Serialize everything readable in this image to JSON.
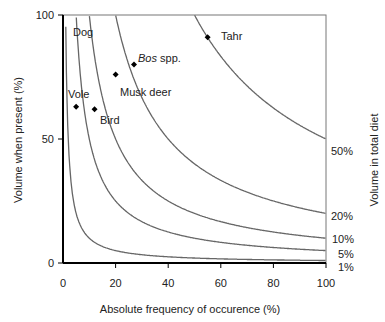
{
  "chart_data": {
    "type": "line",
    "title": "",
    "xlabel": "Absolute frequency of occurence (%)",
    "ylabel": "Volume when present (%)",
    "ylabel_right": "Volume in total diet",
    "xlim": [
      0,
      100
    ],
    "ylim": [
      0,
      100
    ],
    "x_ticks": [
      "0",
      "20",
      "40",
      "60",
      "80",
      "100"
    ],
    "y_ticks": [
      "0",
      "50",
      "100"
    ],
    "grid": false,
    "isolines": [
      {
        "name": "50%",
        "product": 5000
      },
      {
        "name": "20%",
        "product": 2000
      },
      {
        "name": "10%",
        "product": 1000
      },
      {
        "name": "5%",
        "product": 500
      },
      {
        "name": "1%",
        "product": 100
      }
    ],
    "points": [
      {
        "label": "Vole",
        "x": 5,
        "y": 63
      },
      {
        "label": "Bird",
        "x": 12,
        "y": 62
      },
      {
        "label": "Musk deer",
        "x": 20,
        "y": 76
      },
      {
        "label": "Bos spp.",
        "x": 27,
        "y": 80
      },
      {
        "label": "Tahr",
        "x": 55,
        "y": 91
      }
    ],
    "annotations": [
      {
        "label": "Dog",
        "x": 8,
        "y": 95
      }
    ]
  },
  "labels": {
    "x0": "0",
    "x20": "20",
    "x40": "40",
    "x60": "60",
    "x80": "80",
    "x100": "100",
    "y0": "0",
    "y50": "50",
    "y100": "100",
    "l50": "50%",
    "l20": "20%",
    "l10": "10%",
    "l5": "5%",
    "l1": "1%",
    "dog": "Dog",
    "vole": "Vole",
    "bird": "Bird",
    "musk": "Musk deer",
    "bos_italic": "Bos",
    "bos_rest": " spp.",
    "tahr": "Tahr",
    "xlabel": "Absolute frequency of occurence (%)",
    "ylabel": "Volume when present (%)",
    "ylabel_right": "Volume in total diet"
  }
}
